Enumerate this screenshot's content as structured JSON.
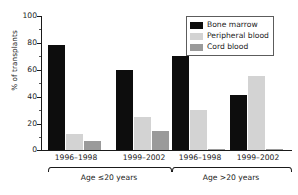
{
  "chart_data": {
    "type": "bar",
    "title": "",
    "xlabel": "",
    "ylabel": "% of transplants",
    "ylim": [
      0,
      100
    ],
    "yticks": [
      0,
      20,
      40,
      60,
      80,
      100
    ],
    "grid": false,
    "legend_position": "top-right",
    "categories": [
      "1996–1998",
      "1999–2002",
      "1996–1998",
      "1999–2002"
    ],
    "group_labels": [
      "Age ≤20 years",
      "Age >20 years"
    ],
    "series": [
      {
        "name": "Bone marrow",
        "color": "#0d0d0d",
        "values": [
          78,
          60,
          70,
          41
        ]
      },
      {
        "name": "Peripheral blood",
        "color": "#d3d3d3",
        "values": [
          12,
          25,
          30,
          55
        ]
      },
      {
        "name": "Cord blood",
        "color": "#9a9a9a",
        "values": [
          7,
          14,
          1,
          1
        ]
      }
    ]
  },
  "axis": {
    "y_title": "% of transplants",
    "y_ticks": [
      "100",
      "80",
      "60",
      "40",
      "20",
      "0"
    ]
  },
  "legend": {
    "items": [
      {
        "label": "Bone marrow"
      },
      {
        "label": "Peripheral blood"
      },
      {
        "label": "Cord blood"
      }
    ]
  },
  "x_axis": {
    "periods": [
      "1996–1998",
      "1999–2002",
      "1996–1998",
      "1999–2002"
    ],
    "groups": [
      "Age ≤20 years",
      "Age >20 years"
    ]
  }
}
